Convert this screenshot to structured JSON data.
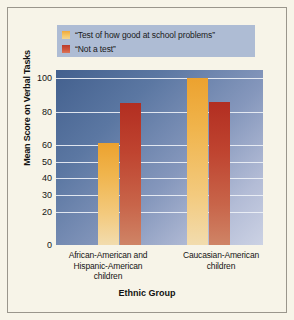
{
  "chart_data": {
    "type": "bar",
    "title": "",
    "xlabel": "Ethnic Group",
    "ylabel": "Mean Score on Verbal Tasks",
    "categories": [
      "African-American and Hispanic-American children",
      "Caucasian-American children"
    ],
    "category_lines": [
      [
        "African-American and",
        "Hispanic-American",
        "children"
      ],
      [
        "Caucasian-American",
        "children"
      ]
    ],
    "series": [
      {
        "name": "“Test of how good at school problems”",
        "color": "#f0b44c",
        "values": [
          61,
          100
        ]
      },
      {
        "name": "“Not a test”",
        "color": "#bf4430",
        "values": [
          85,
          86
        ]
      }
    ],
    "ylim": [
      0,
      105
    ],
    "yticks": [
      0,
      20,
      30,
      40,
      50,
      60,
      80,
      100
    ],
    "ytick_labels": [
      "0",
      "20",
      "30",
      "40",
      "50",
      "60",
      "80",
      "100"
    ],
    "grid": true,
    "legend_position": "top",
    "colors": {
      "page_background": "#f7f4e8",
      "legend_background": "#aebcd4",
      "plot_gradient_start": "#43608e",
      "plot_gradient_end": "#ccd2e4",
      "gridline": "#eef2f7",
      "frame_border": "#9a968c"
    }
  },
  "legend": {
    "items": [
      {
        "label": "“Test of how good at school problems”",
        "swatch": "series-a-swatch"
      },
      {
        "label": "“Not a test”",
        "swatch": "series-b-swatch"
      }
    ]
  }
}
